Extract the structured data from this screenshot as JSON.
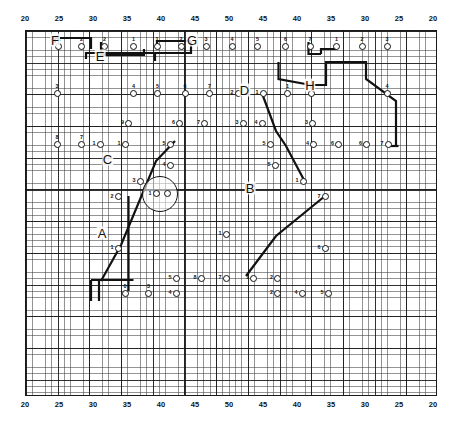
{
  "figure": {
    "kind": "site-plan-grid-chart",
    "colors": {
      "ink": "#111111",
      "grid_major": "#141414",
      "grid_minor": "#3c3c3c",
      "background": "#ffffff"
    }
  },
  "axes": {
    "top_ticks": [
      {
        "label": "20",
        "x": 25
      },
      {
        "label": "25",
        "x": 59
      },
      {
        "label": "30",
        "x": 93
      },
      {
        "label": "35",
        "x": 127
      },
      {
        "label": "40",
        "x": 161
      },
      {
        "label": "45",
        "x": 195
      },
      {
        "label": "50",
        "x": 229
      },
      {
        "label": "45",
        "x": 263
      },
      {
        "label": "40",
        "x": 297
      },
      {
        "label": "35",
        "x": 331
      },
      {
        "label": "30",
        "x": 365
      },
      {
        "label": "25",
        "x": 399
      },
      {
        "label": "20",
        "x": 433
      }
    ],
    "bottom_ticks": [
      {
        "label": "20",
        "x": 25
      },
      {
        "label": "25",
        "x": 59
      },
      {
        "label": "30",
        "x": 93
      },
      {
        "label": "35",
        "x": 127
      },
      {
        "label": "40",
        "x": 161
      },
      {
        "label": "45",
        "x": 195
      },
      {
        "label": "50",
        "x": 229
      },
      {
        "label": "45",
        "x": 263
      },
      {
        "label": "40",
        "x": 297
      },
      {
        "label": "35",
        "x": 331
      },
      {
        "label": "30",
        "x": 365
      },
      {
        "label": "25",
        "x": 399
      },
      {
        "label": "20",
        "x": 433
      }
    ]
  },
  "chart_data": {
    "type": "scatter",
    "title": "",
    "xlabel": "",
    "ylabel": "",
    "grid": true,
    "grid_minor_step_px": 6.338,
    "grid_major_every": 5,
    "xlim": [
      20,
      50,
      20
    ],
    "group_letters": [
      {
        "text": "F",
        "x": 58,
        "y": 18
      },
      {
        "text": "E",
        "x": 148,
        "y": 50
      },
      {
        "text": "G",
        "x": 332,
        "y": 18
      },
      {
        "text": "H",
        "x": 568,
        "y": 108
      },
      {
        "text": "D",
        "x": 437,
        "y": 117
      },
      {
        "text": "C",
        "x": 163,
        "y": 255
      },
      {
        "text": "B",
        "x": 448,
        "y": 314
      },
      {
        "text": "A",
        "x": 152,
        "y": 404
      }
    ],
    "features": [
      {
        "kind": "circle",
        "cx": 268,
        "cy": 325,
        "r": 36
      },
      {
        "kind": "square",
        "cx": 448,
        "cy": 313,
        "w": 20,
        "h": 15
      }
    ],
    "markers": [
      {
        "label": "A",
        "x": 65,
        "y": 31,
        "pos": "above"
      },
      {
        "label": "2",
        "x": 111,
        "y": 31,
        "pos": "above"
      },
      {
        "label": "2",
        "x": 157,
        "y": 31,
        "pos": "above"
      },
      {
        "label": "1",
        "x": 215,
        "y": 31,
        "pos": "above"
      },
      {
        "label": "1",
        "x": 262,
        "y": 31,
        "pos": "above"
      },
      {
        "label": "2",
        "x": 310,
        "y": 31,
        "pos": "above"
      },
      {
        "label": "3",
        "x": 360,
        "y": 31,
        "pos": "above"
      },
      {
        "label": "4",
        "x": 412,
        "y": 31,
        "pos": "above"
      },
      {
        "label": "5",
        "x": 463,
        "y": 31,
        "pos": "above"
      },
      {
        "label": "6",
        "x": 519,
        "y": 31,
        "pos": "above"
      },
      {
        "label": "7",
        "x": 568,
        "y": 31,
        "pos": "above"
      },
      {
        "label": "1",
        "x": 621,
        "y": 31,
        "pos": "above"
      },
      {
        "label": "2",
        "x": 672,
        "y": 31,
        "pos": "above"
      },
      {
        "label": "3",
        "x": 722,
        "y": 31,
        "pos": "above"
      },
      {
        "label": "3",
        "x": 62,
        "y": 124,
        "pos": "above"
      },
      {
        "label": "4",
        "x": 215,
        "y": 124,
        "pos": "above"
      },
      {
        "label": "5",
        "x": 263,
        "y": 124,
        "pos": "above"
      },
      {
        "label": "6",
        "x": 318,
        "y": 124,
        "pos": "above"
      },
      {
        "label": "7",
        "x": 367,
        "y": 124,
        "pos": "above"
      },
      {
        "label": "2",
        "x": 424,
        "y": 124,
        "pos": "left"
      },
      {
        "label": "1",
        "x": 474,
        "y": 124,
        "pos": "left"
      },
      {
        "label": "1",
        "x": 523,
        "y": 124,
        "pos": "above"
      },
      {
        "label": "2",
        "x": 570,
        "y": 124,
        "pos": "above"
      },
      {
        "label": "4",
        "x": 722,
        "y": 124,
        "pos": "above"
      },
      {
        "label": "9",
        "x": 205,
        "y": 184,
        "pos": "left"
      },
      {
        "label": "6",
        "x": 307,
        "y": 184,
        "pos": "left"
      },
      {
        "label": "7",
        "x": 357,
        "y": 184,
        "pos": "left"
      },
      {
        "label": "3",
        "x": 434,
        "y": 184,
        "pos": "left"
      },
      {
        "label": "4",
        "x": 472,
        "y": 184,
        "pos": "left"
      },
      {
        "label": "3",
        "x": 573,
        "y": 184,
        "pos": "left"
      },
      {
        "label": "8",
        "x": 62,
        "y": 226,
        "pos": "above"
      },
      {
        "label": "7",
        "x": 111,
        "y": 226,
        "pos": "above"
      },
      {
        "label": "1",
        "x": 148,
        "y": 226,
        "pos": "left"
      },
      {
        "label": "1",
        "x": 198,
        "y": 226,
        "pos": "left"
      },
      {
        "label": "5",
        "x": 288,
        "y": 226,
        "pos": "left"
      },
      {
        "label": "5",
        "x": 488,
        "y": 226,
        "pos": "left"
      },
      {
        "label": "4",
        "x": 575,
        "y": 226,
        "pos": "left"
      },
      {
        "label": "6",
        "x": 625,
        "y": 226,
        "pos": "left"
      },
      {
        "label": "6",
        "x": 681,
        "y": 226,
        "pos": "left"
      },
      {
        "label": "7",
        "x": 724,
        "y": 226,
        "pos": "left"
      },
      {
        "label": "4",
        "x": 288,
        "y": 268,
        "pos": "left"
      },
      {
        "label": "5",
        "x": 498,
        "y": 268,
        "pos": "left"
      },
      {
        "label": "3",
        "x": 228,
        "y": 300,
        "pos": "left"
      },
      {
        "label": "1",
        "x": 554,
        "y": 300,
        "pos": "left"
      },
      {
        "label": "2",
        "x": 184,
        "y": 331,
        "pos": "left"
      },
      {
        "label": "7",
        "x": 598,
        "y": 331,
        "pos": "left"
      },
      {
        "label": "1",
        "x": 184,
        "y": 434,
        "pos": "left"
      },
      {
        "label": "1",
        "x": 400,
        "y": 406,
        "pos": "left"
      },
      {
        "label": "6",
        "x": 598,
        "y": 434,
        "pos": "left"
      },
      {
        "label": "5",
        "x": 300,
        "y": 494,
        "pos": "left"
      },
      {
        "label": "8",
        "x": 350,
        "y": 494,
        "pos": "left"
      },
      {
        "label": "7",
        "x": 400,
        "y": 494,
        "pos": "left"
      },
      {
        "label": "1",
        "x": 455,
        "y": 494,
        "pos": "left"
      },
      {
        "label": "2",
        "x": 503,
        "y": 494,
        "pos": "left"
      },
      {
        "label": "0",
        "x": 198,
        "y": 524,
        "pos": "above"
      },
      {
        "label": "3",
        "x": 245,
        "y": 524,
        "pos": "above"
      },
      {
        "label": "4",
        "x": 300,
        "y": 524,
        "pos": "left"
      },
      {
        "label": "2",
        "x": 503,
        "y": 524,
        "pos": "left"
      },
      {
        "label": "4",
        "x": 552,
        "y": 524,
        "pos": "left"
      },
      {
        "label": "5",
        "x": 604,
        "y": 524,
        "pos": "left"
      },
      {
        "label": "1",
        "x": 260,
        "y": 325,
        "pos": "left"
      },
      {
        "label": "",
        "x": 282,
        "y": 325,
        "pos": "left"
      }
    ],
    "connectors": [
      {
        "points": [
          [
            58,
            24
          ],
          [
            58,
            14
          ],
          [
            130,
            14
          ],
          [
            130,
            36
          ]
        ]
      },
      {
        "points": [
          [
            150,
            22
          ],
          [
            150,
            48
          ],
          [
            236,
            48
          ],
          [
            236,
            36
          ]
        ]
      },
      {
        "points": [
          [
            120,
            56
          ],
          [
            120,
            44
          ],
          [
            258,
            44
          ],
          [
            258,
            60
          ]
        ]
      },
      {
        "points": [
          [
            258,
            44
          ],
          [
            330,
            44
          ],
          [
            330,
            20
          ]
        ]
      },
      {
        "points": [
          [
            330,
            20
          ],
          [
            262,
            20
          ],
          [
            262,
            36
          ]
        ]
      },
      {
        "points": [
          [
            565,
            22
          ],
          [
            565,
            46
          ],
          [
            590,
            46
          ]
        ]
      },
      {
        "points": [
          [
            590,
            46
          ],
          [
            590,
            36
          ],
          [
            621,
            36
          ]
        ]
      },
      {
        "points": [
          [
            505,
            62
          ],
          [
            505,
            96
          ],
          [
            570,
            108
          ]
        ]
      },
      {
        "points": [
          [
            570,
            108
          ],
          [
            600,
            108
          ],
          [
            600,
            62
          ],
          [
            680,
            62
          ],
          [
            680,
            96
          ],
          [
            740,
            140
          ],
          [
            740,
            230
          ],
          [
            724,
            230
          ]
        ]
      },
      {
        "points": [
          [
            474,
            130
          ],
          [
            500,
            200
          ],
          [
            520,
            230
          ],
          [
            555,
            296
          ]
        ]
      },
      {
        "points": [
          [
            555,
            296
          ],
          [
            560,
            300
          ]
        ]
      },
      {
        "points": [
          [
            190,
            428
          ],
          [
            260,
            260
          ],
          [
            298,
            220
          ]
        ]
      },
      {
        "points": [
          [
            190,
            428
          ],
          [
            150,
            500
          ]
        ]
      },
      {
        "points": [
          [
            440,
            490
          ],
          [
            500,
            410
          ],
          [
            598,
            330
          ]
        ]
      },
      {
        "points": [
          [
            130,
            498
          ],
          [
            130,
            540
          ]
        ]
      },
      {
        "points": [
          [
            146,
            498
          ],
          [
            146,
            540
          ]
        ]
      },
      {
        "points": [
          [
            130,
            498
          ],
          [
            215,
            498
          ]
        ]
      },
      {
        "points": [
          [
            205,
            330
          ],
          [
            205,
            520
          ]
        ]
      },
      {
        "points": [
          [
            724,
            230
          ],
          [
            745,
            230
          ]
        ]
      }
    ]
  }
}
